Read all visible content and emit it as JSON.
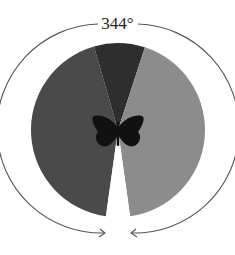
{
  "figure": {
    "angle_label": "344°",
    "center_icon": "butterfly-icon",
    "colors": {
      "left_field": "#4a4a4a",
      "right_field": "#8c8c8c",
      "binocular_front": "#2e2e2e",
      "blind_spot": "#ffffff",
      "butterfly": "#111111",
      "arc": "#444444"
    },
    "sectors": [
      {
        "name": "binocular-overlap",
        "start_deg": -16,
        "end_deg": 18
      },
      {
        "name": "right-monocular-field",
        "start_deg": 18,
        "end_deg": 172
      },
      {
        "name": "blind-spot",
        "start_deg": 172,
        "end_deg": 188
      },
      {
        "name": "left-monocular-field",
        "start_deg": 188,
        "end_deg": 344
      }
    ]
  }
}
